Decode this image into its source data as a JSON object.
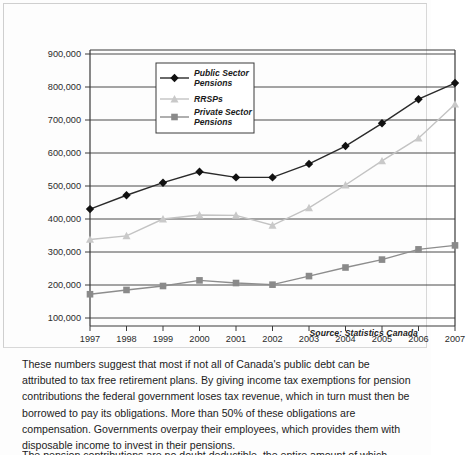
{
  "figure": {
    "source_note": "Source: Statistics Canada"
  },
  "chart_data": {
    "type": "line",
    "title": "",
    "xlabel": "",
    "ylabel": "",
    "categories": [
      "1997",
      "1998",
      "1999",
      "2000",
      "2001",
      "2002",
      "2003",
      "2004",
      "2005",
      "2006",
      "2007"
    ],
    "x": [
      1997,
      1998,
      1999,
      2000,
      2001,
      2002,
      2003,
      2004,
      2005,
      2006,
      2007
    ],
    "ylim": [
      0,
      900000
    ],
    "xlim": [
      1997,
      2007
    ],
    "y_ticks": [
      100000,
      200000,
      300000,
      400000,
      500000,
      600000,
      700000,
      800000,
      900000
    ],
    "y_tick_labels": [
      "100,000",
      "200,000",
      "300,000",
      "400,000",
      "500,000",
      "600,000",
      "700,000",
      "800,000",
      "900,000"
    ],
    "grid": true,
    "legend_position": "upper-left-inside",
    "series": [
      {
        "name": "Public Sector Pensions",
        "marker": "diamond",
        "color": "#111111",
        "line_color": "#2a2a2a",
        "values": [
          430000,
          472000,
          510000,
          543000,
          526000,
          526000,
          567000,
          621000,
          690000,
          763000,
          812000
        ]
      },
      {
        "name": "RRSPs",
        "marker": "triangle",
        "color": "#c9c9c9",
        "line_color": "#c3c3c3",
        "values": [
          338000,
          349000,
          400000,
          412000,
          411000,
          381000,
          434000,
          503000,
          576000,
          645000,
          748000
        ]
      },
      {
        "name": "Private Sector Pensions",
        "marker": "square",
        "color": "#8a8a8a",
        "line_color": "#8d8d8d",
        "values": [
          172000,
          185000,
          197000,
          214000,
          206000,
          201000,
          227000,
          253000,
          277000,
          308000,
          320000
        ]
      }
    ]
  },
  "body": {
    "paragraph": "These numbers suggest that most if not all of Canada's public debt can be attributed to tax free retirement plans. By giving income tax exemptions for pension contributions the federal government loses tax revenue, which in turn must then be borrowed to pay its obligations. More than 50% of these obligations are compensation. Governments overpay their employees, which provides them with disposable income to invest in their pensions.",
    "clipped_line": "The pension contributions are no doubt deductible, the entire amount of which"
  }
}
